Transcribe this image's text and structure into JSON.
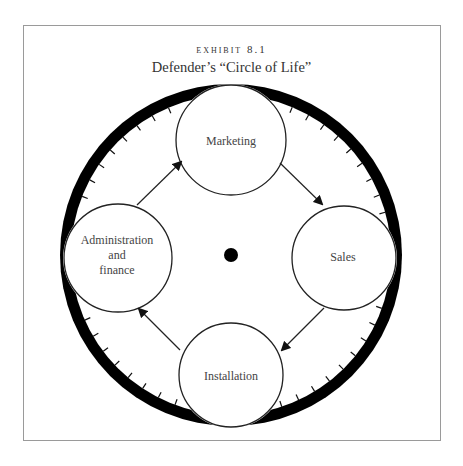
{
  "exhibit": {
    "label": "EXHIBIT 8.1",
    "title": "Defender’s “Circle of Life”"
  },
  "diagram": {
    "nodes": [
      {
        "id": "marketing",
        "label": "Marketing"
      },
      {
        "id": "sales",
        "label": "Sales"
      },
      {
        "id": "installation",
        "label": "Installation"
      },
      {
        "id": "admin",
        "label_lines": [
          "Administration",
          "and",
          "finance"
        ]
      }
    ],
    "flow": [
      {
        "from": "Administration and finance",
        "to": "Marketing"
      },
      {
        "from": "Marketing",
        "to": "Sales"
      },
      {
        "from": "Sales",
        "to": "Installation"
      },
      {
        "from": "Installation",
        "to": "Administration and finance"
      }
    ],
    "center_marker": "hub-dot",
    "colors": {
      "ring": "#000000",
      "stroke": "#222222",
      "text": "#444444",
      "frame": "#9a9a9a"
    }
  }
}
